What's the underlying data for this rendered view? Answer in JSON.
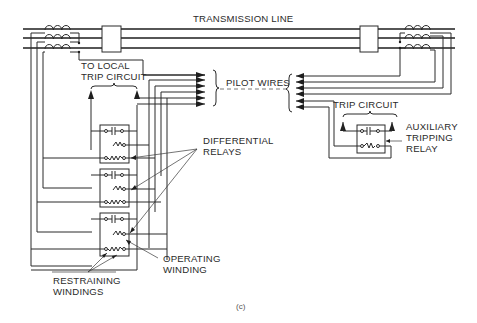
{
  "figure": {
    "caption": "(c)",
    "colors": {
      "ink": "#2a2a2a",
      "background": "#ffffff"
    }
  },
  "labels": {
    "transmission_line": "TRANSMISSION LINE",
    "to_local_trip_circuit_1": "TO LOCAL",
    "to_local_trip_circuit_2": "TRIP CIRCUIT",
    "pilot_wires": "PILOT WIRES",
    "differential_relays_1": "DIFFERENTIAL",
    "differential_relays_2": "RELAYS",
    "trip_circuit": "TRIP CIRCUIT",
    "auxiliary_1": "AUXILIARY",
    "auxiliary_2": "TRIPPING",
    "auxiliary_3": "RELAY",
    "operating_winding_1": "OPERATING",
    "operating_winding_2": "WINDING",
    "restraining_windings_1": "RESTRAINING",
    "restraining_windings_2": "WINDINGS"
  },
  "components": {
    "phases": 3,
    "current_transformers": [
      "left-ct-set",
      "right-ct-set"
    ],
    "circuit_breakers": [
      "left-breaker",
      "right-breaker"
    ],
    "differential_relays": 3,
    "pilot_wire_count": 6,
    "auxiliary_relays": 1
  }
}
